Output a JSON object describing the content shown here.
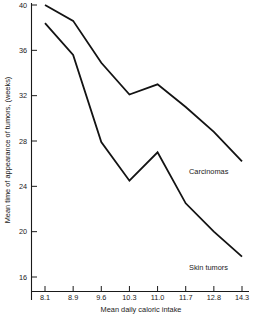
{
  "chart_data": {
    "type": "line",
    "title": "",
    "xlabel": "Mean daily caloric intake",
    "ylabel": "Mean time of appearance of tumors, (weeks)",
    "categories": [
      "8.1",
      "8.9",
      "9.6",
      "10.3",
      "11.0",
      "11.7",
      "12.8",
      "14.3"
    ],
    "x": [
      8.1,
      8.9,
      9.6,
      10.3,
      11.0,
      11.7,
      12.8,
      14.3
    ],
    "xtick_labels": [
      "8.1",
      "8.9",
      "9.6",
      "10.3",
      "11.0",
      "11.7",
      "12.8",
      "14.3"
    ],
    "ytick_labels": [
      "40",
      "36",
      "32",
      "28",
      "24",
      "20",
      "16"
    ],
    "yticks": [
      40,
      36,
      32,
      28,
      24,
      20,
      16
    ],
    "ylim": [
      14.5,
      40.0
    ],
    "grid": false,
    "legend_position": "inline-right",
    "series": [
      {
        "name": "Carcinomas",
        "label": "Carcinomas",
        "values": [
          40.0,
          38.6,
          34.9,
          32.1,
          33.0,
          31.0,
          28.8,
          26.2
        ],
        "color": "#131313"
      },
      {
        "name": "Skin tumors",
        "label": "Skin tumors",
        "values": [
          38.4,
          35.6,
          27.9,
          24.5,
          27.0,
          22.5,
          20.0,
          17.8
        ],
        "color": "#131313"
      }
    ],
    "annotations": [
      {
        "text": "Carcinomas",
        "series": "Carcinomas"
      },
      {
        "text": "Skin tumors",
        "series": "Skin tumors"
      }
    ]
  }
}
